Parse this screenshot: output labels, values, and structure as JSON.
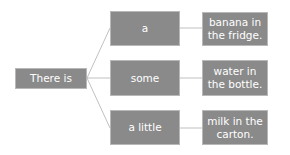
{
  "diagram": {
    "root": {
      "label": "There is"
    },
    "quantifiers": [
      {
        "label": "a"
      },
      {
        "label": "some"
      },
      {
        "label": "a little"
      }
    ],
    "completions": [
      {
        "label": "banana in the fridge."
      },
      {
        "label": "water in the bottle."
      },
      {
        "label": "milk in the carton."
      }
    ],
    "colors": {
      "box_fill": "#8a8a8a",
      "box_border": "#b8b8b8",
      "text": "#ffffff",
      "connector": "#b0b0b0"
    }
  }
}
